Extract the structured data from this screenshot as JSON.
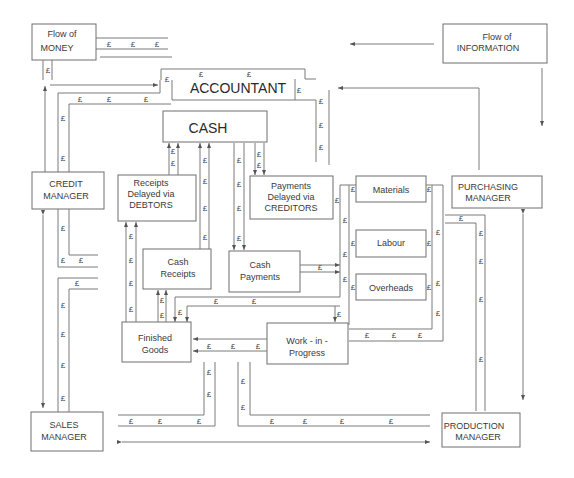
{
  "legend": {
    "money": {
      "line1": "Flow of",
      "line2": "MONEY",
      "symbol": "£"
    },
    "information": {
      "line1": "Flow of",
      "line2": "INFORMATION"
    }
  },
  "nodes": {
    "accountant": "ACCOUNTANT",
    "cash": "CASH",
    "credit_manager": {
      "line1": "CREDIT",
      "line2": "MANAGER"
    },
    "receipts_delayed": {
      "line1": "Receipts",
      "line2": "Delayed via",
      "line3": "DEBTORS"
    },
    "payments_delayed": {
      "line1": "Payments",
      "line2": "Delayed via",
      "line3": "CREDITORS"
    },
    "cash_receipts": {
      "line1": "Cash",
      "line2": "Receipts"
    },
    "cash_payments": {
      "line1": "Cash",
      "line2": "Payments"
    },
    "materials": "Materials",
    "labour": "Labour",
    "overheads": "Overheads",
    "purchasing_manager": {
      "line1": "PURCHASING",
      "line2": "MANAGER"
    },
    "finished_goods": {
      "line1": "Finished",
      "line2": "Goods"
    },
    "work_in_progress": {
      "line1": "Work - in -",
      "line2": "Progress"
    },
    "sales_manager": {
      "line1": "SALES",
      "line2": "MANAGER"
    },
    "production_manager": {
      "line1": "PRODUCTION",
      "line2": "MANAGER"
    }
  },
  "currency_symbol": "£"
}
